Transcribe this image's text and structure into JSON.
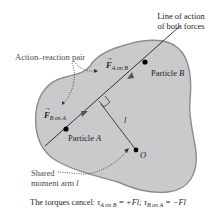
{
  "labels": {
    "line_of_action": [
      "Line of action",
      "of both forces"
    ],
    "action_reaction": "Action–reaction pair",
    "force_a_on_b": {
      "symbol": "F",
      "sub": "A on B"
    },
    "force_b_on_a": {
      "symbol": "F",
      "sub": "B on A"
    },
    "particle_b": {
      "text": "Particle ",
      "var": "B"
    },
    "particle_a": {
      "text": "Particle ",
      "var": "A"
    },
    "moment_arm_symbol": "l",
    "origin": "O",
    "shared_moment_arm": [
      "Shared",
      "moment arm "
    ],
    "shared_moment_arm_var": "l"
  },
  "caption": {
    "prefix": "The torques cancel: ",
    "tau1": "τ",
    "tau1_sub": "A on B",
    "tau1_val": " = +Fl; ",
    "tau2": "τ",
    "tau2_sub": "B on A",
    "tau2_val": " = −Fl"
  },
  "colors": {
    "body_fill": "#c9cacc",
    "body_stroke": "#8c8d8f",
    "line": "#231f20"
  }
}
